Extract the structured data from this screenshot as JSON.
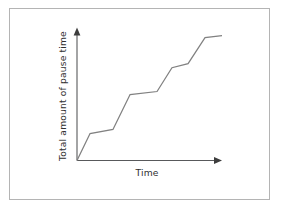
{
  "figure": {
    "background_color": "#ffffff",
    "frame_color": "#b4b4b4",
    "line_color": "#818181",
    "axis_color": "#58595b",
    "text_color": "#2f2f2f",
    "x_axis_label": "Time",
    "y_axis_label": "Total amount of pause time"
  },
  "chart_data": {
    "type": "line",
    "title": "",
    "subtitle": "",
    "xlabel": "Time",
    "ylabel": "Total amount of pause time",
    "xlim": [
      0,
      100
    ],
    "ylim": [
      0,
      100
    ],
    "grid": false,
    "legend": false,
    "legend_position": "none",
    "axis_ticks": false,
    "tick_labels": {
      "x": [],
      "y": []
    },
    "annotations": [],
    "series": [
      {
        "name": "Total amount of pause time",
        "color": "#818181",
        "x": [
          0,
          9.0,
          24.8,
          36.6,
          55.2,
          65.5,
          76.6,
          88.3,
          100.0
        ],
        "y": [
          0,
          20.6,
          23.7,
          50.4,
          52.7,
          70.9,
          74.0,
          93.8,
          95.4
        ],
        "points": [
          {
            "x": 0,
            "y": 0,
            "kind": "origin"
          },
          {
            "x": 9.0,
            "y": 20.6,
            "kind": "rise-end"
          },
          {
            "x": 24.8,
            "y": 23.7,
            "kind": "plateau-end"
          },
          {
            "x": 36.6,
            "y": 50.4,
            "kind": "rise-end"
          },
          {
            "x": 55.2,
            "y": 52.7,
            "kind": "plateau-end"
          },
          {
            "x": 65.5,
            "y": 70.9,
            "kind": "rise-end"
          },
          {
            "x": 76.6,
            "y": 74.0,
            "kind": "plateau-end"
          },
          {
            "x": 88.3,
            "y": 93.8,
            "kind": "rise-end"
          },
          {
            "x": 100.0,
            "y": 95.4,
            "kind": "plateau-end"
          }
        ]
      }
    ]
  }
}
